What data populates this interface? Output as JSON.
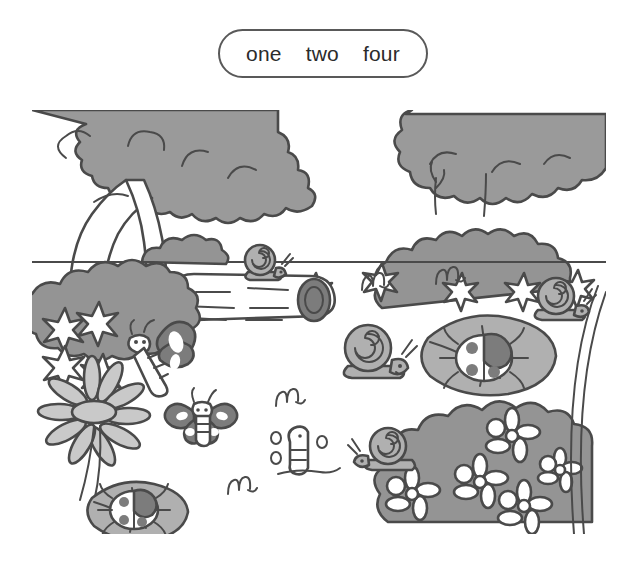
{
  "page": {
    "background_color": "#ffffff",
    "width": 637,
    "height": 584
  },
  "answer_box": {
    "border_color": "#595959",
    "background_color": "#ffffff",
    "words": [
      {
        "text": "one"
      },
      {
        "text": "two"
      },
      {
        "text": "four"
      }
    ]
  },
  "illustration": {
    "title": "garden-scene",
    "description": "Grayscale cartoon garden scene with trees, bushes, a fallen log, snails, butterflies, ladybugs on leaves, a daisy and grass tufts",
    "palette": {
      "outline": "#4a4a4a",
      "foliage_gray": "#9a9a9a",
      "bush_gray": "#949494",
      "leaf_gray": "#b0b0b0",
      "petal_gray": "#c9c9c9",
      "dark_accent": "#7c7c7c",
      "white": "#ffffff",
      "ground_line": "#4a4a4a"
    },
    "elements": [
      {
        "name": "left-tree",
        "label": "left tree with large canopy"
      },
      {
        "name": "background-tree",
        "label": "background tree on right"
      },
      {
        "name": "horizon-line",
        "label": "ground horizon line"
      },
      {
        "name": "fallen-log",
        "label": "fallen log"
      },
      {
        "name": "log-snail",
        "label": "snail on log"
      },
      {
        "name": "left-bush",
        "label": "left bush with star flowers"
      },
      {
        "name": "right-bush-row",
        "label": "background bush row with flowers"
      },
      {
        "name": "flowering-bush",
        "label": "foreground flowering bush bottom right"
      },
      {
        "name": "daisy",
        "label": "large daisy flower"
      },
      {
        "name": "big-butterfly",
        "label": "large butterfly on bush"
      },
      {
        "name": "small-butterfly",
        "label": "small butterfly"
      },
      {
        "name": "ladybug-leaf-left",
        "label": "ladybug on leaf lower left"
      },
      {
        "name": "ladybug-leaf-right",
        "label": "ladybug on leaf right"
      },
      {
        "name": "snail-center",
        "label": "snail in center"
      },
      {
        "name": "snail-upper-right",
        "label": "snail upper right"
      },
      {
        "name": "snail-lower-right",
        "label": "snail lower right"
      },
      {
        "name": "caterpillar",
        "label": "caterpillar on ground"
      },
      {
        "name": "grass-tufts",
        "label": "small grass tufts"
      },
      {
        "name": "tall-stem",
        "label": "tall curved stem right edge"
      }
    ]
  }
}
